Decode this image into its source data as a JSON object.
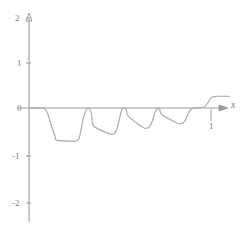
{
  "chart_data": {
    "type": "line",
    "title": "",
    "subtitle": "",
    "xlabel": "x",
    "ylabel": "",
    "xlim": [
      -0.09,
      1.18
    ],
    "ylim": [
      -2.35,
      2.22
    ],
    "grid": false,
    "legend": null,
    "x_ticks": [
      {
        "value": 1,
        "label": "1"
      }
    ],
    "y_ticks": [
      {
        "value": 2,
        "label": "2"
      },
      {
        "value": 1,
        "label": "1"
      },
      {
        "value": 0,
        "label": "0"
      },
      {
        "value": -1,
        "label": "-1"
      },
      {
        "value": -2,
        "label": "-2"
      }
    ],
    "series": [
      {
        "name": "step-function",
        "color": "#a8a8a8",
        "x": [
          -0.06,
          0.07,
          0.085,
          0.1,
          0.12,
          0.145,
          0.155,
          0.245,
          0.26,
          0.275,
          0.285,
          0.3,
          0.315,
          0.325,
          0.335,
          0.345,
          0.355,
          0.44,
          0.455,
          0.47,
          0.48,
          0.495,
          0.505,
          0.515,
          0.525,
          0.535,
          0.545,
          0.625,
          0.64,
          0.655,
          0.665,
          0.68,
          0.69,
          0.7,
          0.71,
          0.72,
          0.73,
          0.81,
          0.825,
          0.84,
          0.85,
          0.865,
          0.875,
          0.885,
          0.895,
          0.905,
          0.92,
          0.95,
          0.965,
          0.98,
          0.995,
          1.01,
          1.03,
          1.1
        ],
        "y": [
          0,
          0,
          -0.02,
          -0.1,
          -0.35,
          -0.66,
          -0.72,
          -0.74,
          -0.73,
          -0.68,
          -0.5,
          -0.2,
          -0.04,
          0,
          -0.03,
          -0.16,
          -0.4,
          -0.57,
          -0.58,
          -0.565,
          -0.5,
          -0.28,
          -0.09,
          -0.01,
          0,
          -0.04,
          -0.18,
          -0.43,
          -0.45,
          -0.44,
          -0.4,
          -0.26,
          -0.12,
          -0.04,
          -0.01,
          -0.05,
          -0.15,
          -0.33,
          -0.35,
          -0.345,
          -0.32,
          -0.22,
          -0.12,
          -0.05,
          -0.015,
          0,
          0.005,
          0.01,
          0.03,
          0.1,
          0.2,
          0.25,
          0.26,
          0.26
        ],
        "description": "Piecewise smooth step wave with four successive negative plateaus of decreasing depth (approximately -0.74, -0.58, -0.45, -0.35) separated by returns toward zero, ending with a rise to a positive plateau near +0.26."
      }
    ],
    "plateau_levels": [
      -0.74,
      -0.58,
      -0.45,
      -0.35,
      0.26
    ],
    "axis_arrows": {
      "x": true,
      "y": true
    },
    "axis_color": "#9a9a9a",
    "curve_color": "#a8a8a8",
    "background": "#ffffff"
  }
}
